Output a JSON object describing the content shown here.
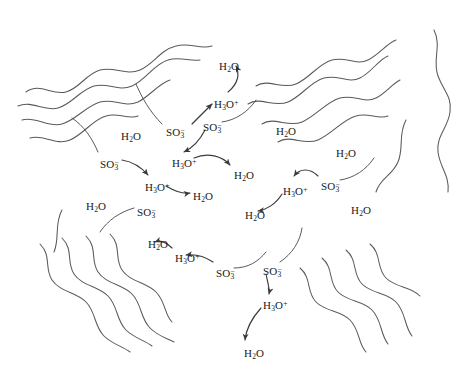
{
  "figure": {
    "kind": "schematic-diagram",
    "background_color": "#ffffff",
    "stroke_color": "#5a5a5a",
    "text_color": "#1a1a1a",
    "width": 465,
    "height": 372
  },
  "species": {
    "water": {
      "base": "H",
      "sub1": "2",
      "tail": "O",
      "plain": "H2O"
    },
    "hydronium": {
      "base": "H",
      "sub1": "3",
      "tail": "O",
      "charge": "+",
      "plain": "H3O+"
    },
    "sulfonate": {
      "base": "SO",
      "sub1": "3",
      "charge": "−",
      "plain": "SO3-"
    }
  },
  "labels": [
    {
      "id": "h2o-1",
      "species": "water",
      "x": 219,
      "y": 61
    },
    {
      "id": "h3o-1",
      "species": "hydronium",
      "x": 214,
      "y": 99
    },
    {
      "id": "so3-1",
      "species": "sulfonate",
      "x": 203,
      "y": 122
    },
    {
      "id": "so3-2",
      "species": "sulfonate",
      "x": 166,
      "y": 127
    },
    {
      "id": "h2o-2",
      "species": "water",
      "x": 121,
      "y": 131
    },
    {
      "id": "h2o-3",
      "species": "water",
      "x": 276,
      "y": 126
    },
    {
      "id": "h2o-4",
      "species": "water",
      "x": 336,
      "y": 148
    },
    {
      "id": "so3-3",
      "species": "sulfonate",
      "x": 100,
      "y": 159
    },
    {
      "id": "h3o-2",
      "species": "hydronium",
      "x": 172,
      "y": 158
    },
    {
      "id": "h2o-5",
      "species": "water",
      "x": 234,
      "y": 170
    },
    {
      "id": "h3o-3",
      "species": "hydronium",
      "x": 145,
      "y": 182
    },
    {
      "id": "h2o-6",
      "species": "water",
      "x": 193,
      "y": 191
    },
    {
      "id": "h3o-4",
      "species": "hydronium",
      "x": 283,
      "y": 186
    },
    {
      "id": "so3-4",
      "species": "sulfonate",
      "x": 321,
      "y": 181
    },
    {
      "id": "h2o-7",
      "species": "water",
      "x": 245,
      "y": 210
    },
    {
      "id": "h2o-8",
      "species": "water",
      "x": 86,
      "y": 201
    },
    {
      "id": "so3-5",
      "species": "sulfonate",
      "x": 137,
      "y": 207
    },
    {
      "id": "h2o-9",
      "species": "water",
      "x": 351,
      "y": 205
    },
    {
      "id": "h2o-10",
      "species": "water",
      "x": 148,
      "y": 239
    },
    {
      "id": "h3o-5",
      "species": "hydronium",
      "x": 175,
      "y": 253
    },
    {
      "id": "so3-6",
      "species": "sulfonate",
      "x": 216,
      "y": 268
    },
    {
      "id": "so3-7",
      "species": "sulfonate",
      "x": 263,
      "y": 266
    },
    {
      "id": "h3o-6",
      "species": "hydronium",
      "x": 263,
      "y": 300
    },
    {
      "id": "h2o-11",
      "species": "water",
      "x": 244,
      "y": 348
    }
  ],
  "polymer_chains": [
    {
      "id": "chain-tl-1",
      "d": "M 26 92 C 40 82, 52 96, 66 92 C 80 88, 86 74, 100 70 C 114 66, 126 76, 140 70 C 154 64, 160 50, 176 46 C 190 42, 200 50, 212 46"
    },
    {
      "id": "chain-tl-2",
      "d": "M 18 106 C 32 100, 44 112, 58 108 C 72 104, 80 90, 94 86 C 108 82, 118 92, 132 86 C 146 80, 154 64, 168 60 C 180 56, 190 62, 200 60"
    },
    {
      "id": "chain-tl-3",
      "d": "M 22 120 C 36 116, 48 128, 62 124 C 76 120, 86 106, 100 102 C 114 98, 124 108, 138 102 C 150 96, 158 84, 170 80"
    },
    {
      "id": "chain-tl-4",
      "d": "M 30 138 C 44 134, 56 146, 70 140 C 84 134, 92 120, 106 116 C 118 112, 128 120, 138 116"
    },
    {
      "id": "chain-tr-1",
      "d": "M 256 86 C 268 78, 282 90, 296 84 C 310 78, 318 64, 332 60 C 346 56, 356 66, 368 60 C 380 54, 386 44, 396 40"
    },
    {
      "id": "chain-tr-2",
      "d": "M 248 104 C 260 96, 274 108, 288 102 C 302 96, 310 82, 324 78 C 338 74, 348 84, 360 78 C 372 72, 378 60, 388 56"
    },
    {
      "id": "chain-tr-3",
      "d": "M 262 124 C 274 116, 288 128, 302 122 C 316 116, 326 102, 340 98 C 354 94, 364 104, 376 98 C 386 93, 392 84, 400 80"
    },
    {
      "id": "chain-tr-4",
      "d": "M 278 142 C 290 134, 304 146, 318 140 C 332 134, 342 120, 356 116 C 368 112, 378 120, 388 116"
    },
    {
      "id": "chain-bl-1",
      "d": "M 40 244 C 52 256, 44 268, 52 280 C 60 292, 76 292, 86 302 C 96 312, 94 326, 104 336 C 112 344, 122 346, 130 352"
    },
    {
      "id": "chain-bl-2",
      "d": "M 62 238 C 74 250, 66 262, 74 274 C 82 286, 98 286, 108 296 C 118 306, 116 320, 126 330 C 134 338, 144 340, 152 346"
    },
    {
      "id": "chain-bl-3",
      "d": "M 86 236 C 98 248, 90 260, 98 272 C 106 284, 122 284, 132 294 C 142 304, 140 318, 150 328 C 158 336, 166 338, 174 342"
    },
    {
      "id": "chain-bl-4",
      "d": "M 110 234 C 122 246, 114 258, 122 270 C 130 282, 146 282, 156 292 C 166 302, 164 314, 172 322"
    },
    {
      "id": "chain-br-1",
      "d": "M 300 268 C 312 278, 306 292, 316 302 C 326 312, 340 310, 350 320 C 360 330, 358 344, 366 352"
    },
    {
      "id": "chain-br-2",
      "d": "M 322 258 C 334 268, 328 282, 338 292 C 348 302, 362 300, 372 310 C 382 320, 380 334, 388 344"
    },
    {
      "id": "chain-br-3",
      "d": "M 346 250 C 358 260, 352 274, 362 284 C 372 294, 386 292, 396 302 C 406 312, 404 326, 412 336"
    },
    {
      "id": "chain-br-4",
      "d": "M 370 244 C 382 254, 376 268, 386 278 C 396 288, 410 286, 420 296"
    },
    {
      "id": "chain-right-edge",
      "d": "M 434 30 C 442 46, 432 60, 438 76 C 444 92, 452 96, 450 112 C 448 128, 436 136, 438 152 C 440 168, 450 176, 448 192"
    },
    {
      "id": "chain-right-lower",
      "d": "M 406 120 C 398 134, 404 148, 398 162 C 392 176, 380 178, 376 192"
    },
    {
      "id": "chain-left-lower",
      "d": "M 62 210 C 54 224, 60 238, 54 252"
    }
  ],
  "pendant_stems": [
    {
      "id": "stem-so3-1",
      "d": "M 222 122 C 236 120, 248 112, 256 100"
    },
    {
      "id": "stem-so3-2",
      "d": "M 162 124 C 150 112, 142 98, 136 84"
    },
    {
      "id": "stem-so3-3",
      "d": "M 98 152 C 92 138, 84 126, 72 118"
    },
    {
      "id": "stem-so3-4",
      "d": "M 340 180 C 354 178, 366 170, 374 158"
    },
    {
      "id": "stem-so3-5",
      "d": "M 134 208 C 120 212, 108 220, 100 232"
    },
    {
      "id": "stem-so3-6",
      "d": "M 234 268 C 248 268, 258 262, 266 252"
    },
    {
      "id": "stem-so3-7",
      "d": "M 280 262 C 292 254, 300 242, 302 228"
    }
  ],
  "reaction_arrows": [
    {
      "id": "arrow-1",
      "from": "h3o-1",
      "to": "h2o-1",
      "d": "M 228 92 C 238 84, 240 74, 236 66"
    },
    {
      "id": "arrow-2",
      "from": "so3-1",
      "to": "h3o-2",
      "d": "M 205 130 C 200 140, 192 148, 184 152"
    },
    {
      "id": "arrow-3",
      "from": "so3-3",
      "to": "h3o-3",
      "d": "M 122 160 C 134 162, 142 168, 148 175"
    },
    {
      "id": "arrow-4",
      "from": "h3o-3",
      "to": "h2o-6",
      "d": "M 166 186 C 176 192, 184 194, 190 193"
    },
    {
      "id": "arrow-5",
      "from": "h3o-2",
      "to": "h2o-5",
      "d": "M 194 158 C 208 152, 222 156, 230 165"
    },
    {
      "id": "arrow-6",
      "from": "so3-4",
      "to": "h3o-4",
      "d": "M 318 176 C 310 168, 300 168, 294 176"
    },
    {
      "id": "arrow-7",
      "from": "h3o-4",
      "to": "h2o-7",
      "d": "M 282 194 C 276 204, 266 210, 258 211"
    },
    {
      "id": "arrow-8",
      "from": "so3-6",
      "to": "h3o-5",
      "d": "M 213 262 C 204 256, 194 254, 186 255"
    },
    {
      "id": "arrow-9",
      "from": "h3o-5",
      "to": "h2o-10",
      "d": "M 172 248 C 166 242, 160 240, 155 242"
    },
    {
      "id": "arrow-10",
      "from": "so3-7",
      "to": "h3o-6",
      "d": "M 266 274 C 268 284, 270 290, 269 294"
    },
    {
      "id": "arrow-11",
      "from": "h3o-6",
      "to": "h2o-11",
      "d": "M 261 308 C 252 318, 246 330, 245 340"
    },
    {
      "id": "arrow-12",
      "from": "so3-2",
      "to": "h3o-1",
      "d": "M 192 124 C 200 116, 208 108, 212 104"
    }
  ]
}
